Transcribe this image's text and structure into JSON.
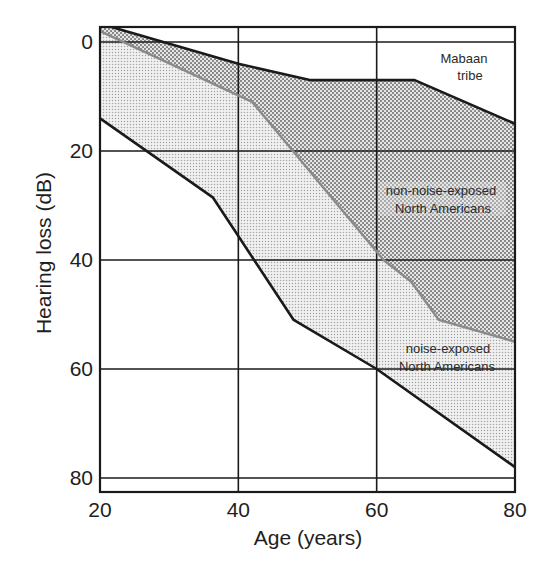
{
  "chart_data": {
    "type": "area",
    "title": "",
    "xlabel": "Age (years)",
    "ylabel": "Hearing loss (dB)",
    "xlim": [
      20,
      80
    ],
    "ylim": [
      -3,
      82.5
    ],
    "y_inverted": true,
    "x_ticks": [
      20,
      40,
      60,
      80
    ],
    "y_ticks": [
      0,
      20,
      40,
      60,
      80
    ],
    "grid": true,
    "series": [
      {
        "name": "Mabaan tribe",
        "style": "black line (upper boundary)",
        "points": [
          [
            21,
            -3
          ],
          [
            40,
            4
          ],
          [
            50.5,
            7
          ],
          [
            65.5,
            7
          ],
          [
            80,
            15
          ]
        ]
      },
      {
        "name": "non-noise-exposed North Americans",
        "style": "gray line",
        "points": [
          [
            20,
            -2
          ],
          [
            42,
            11
          ],
          [
            61,
            40
          ],
          [
            65,
            44
          ],
          [
            69,
            51
          ],
          [
            80,
            55
          ]
        ]
      },
      {
        "name": "noise-exposed North Americans",
        "style": "black line (lower boundary)",
        "points": [
          [
            20,
            14
          ],
          [
            36.3,
            28.5
          ],
          [
            48,
            51
          ],
          [
            60,
            60
          ],
          [
            80,
            78
          ]
        ]
      }
    ],
    "shaded_regions": [
      {
        "between": [
          "Mabaan tribe",
          "non-noise-exposed North Americans"
        ],
        "pattern": "coarse dot screen"
      },
      {
        "between": [
          "non-noise-exposed North Americans",
          "noise-exposed North Americans"
        ],
        "pattern": "fine dot screen"
      }
    ],
    "annotations": [
      {
        "lines": [
          "Mabaan",
          "tribe"
        ],
        "anchor": "upper right"
      },
      {
        "lines": [
          "non-noise-exposed",
          "North Americans"
        ],
        "anchor": "right, ~27 dB"
      },
      {
        "lines": [
          "noise-exposed",
          "North Americans"
        ],
        "anchor": "right, ~58 dB"
      }
    ]
  },
  "labels": {
    "xlabel": "Age (years)",
    "ylabel": "Hearing loss (dB)",
    "x_ticks": [
      "20",
      "40",
      "60",
      "80"
    ],
    "y_ticks": [
      "0",
      "20",
      "40",
      "60",
      "80"
    ],
    "mabaan": [
      "Mabaan",
      "tribe"
    ],
    "non_noise": [
      "non-noise-exposed",
      "North Americans"
    ],
    "noise": [
      "noise-exposed",
      "North Americans"
    ]
  },
  "colors": {
    "line_dark": "#1a1a1a",
    "line_gray": "#8a8a8a",
    "dots": "#8c8c8c"
  }
}
